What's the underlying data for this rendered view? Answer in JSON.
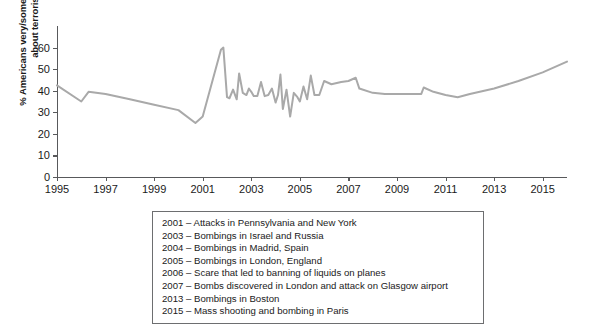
{
  "chart_data": {
    "type": "line",
    "title": "",
    "xlabel": "",
    "ylabel": "% Americans very/somewhat worried about terrorism",
    "xlim": [
      1995,
      2016
    ],
    "ylim": [
      0,
      70
    ],
    "grid": false,
    "legend_position": "below-plot",
    "line_color": "#a9a9a9",
    "x": [
      1995,
      1996.0,
      1996.3,
      1997,
      1998,
      1999,
      2000,
      2000.7,
      2001.0,
      2001.75,
      2001.85,
      2002.0,
      2002.1,
      2002.25,
      2002.4,
      2002.5,
      2002.65,
      2002.8,
      2002.9,
      2003.0,
      2003.1,
      2003.25,
      2003.4,
      2003.55,
      2003.7,
      2003.85,
      2004.0,
      2004.1,
      2004.2,
      2004.3,
      2004.45,
      2004.6,
      2004.75,
      2004.9,
      2005.0,
      2005.15,
      2005.3,
      2005.45,
      2005.6,
      2005.8,
      2006.0,
      2006.3,
      2006.7,
      2007.0,
      2007.3,
      2007.45,
      2008.0,
      2008.5,
      2009.0,
      2009.5,
      2010.0,
      2010.1,
      2010.5,
      2011.0,
      2011.5,
      2012.0,
      2013.0,
      2014.0,
      2015.0,
      2016.0
    ],
    "y": [
      42.5,
      35.0,
      39.5,
      38.5,
      36.0,
      33.5,
      31.0,
      25.0,
      28.0,
      59.0,
      60.0,
      37.0,
      36.5,
      40.5,
      36.0,
      48.0,
      39.0,
      38.0,
      41.0,
      39.5,
      37.5,
      37.5,
      44.0,
      37.5,
      38.0,
      41.0,
      34.5,
      38.0,
      47.5,
      31.5,
      40.5,
      28.0,
      39.0,
      37.0,
      35.0,
      42.0,
      36.0,
      47.0,
      38.0,
      38.0,
      44.5,
      43.0,
      44.0,
      44.5,
      46.0,
      41.0,
      39.0,
      38.5,
      38.5,
      38.5,
      38.5,
      41.5,
      39.5,
      38.0,
      37.0,
      38.5,
      41.0,
      44.5,
      48.5,
      53.5
    ],
    "yticks": [
      0,
      10,
      20,
      30,
      40,
      50,
      60
    ],
    "xticks": [
      1995,
      1997,
      1999,
      2001,
      2003,
      2005,
      2007,
      2009,
      2011,
      2013,
      2015
    ],
    "annotations": [
      "2001 – Attacks in Pennsylvania and New York",
      "2003 – Bombings in Israel and Russia",
      "2004 – Bombings in Madrid, Spain",
      "2005 – Bombings in London, England",
      "2006 – Scare that led to banning of liquids on planes",
      "2007 – Bombs discovered in London and attack on Glasgow airport",
      "2013 – Bombings in Boston",
      "2015 – Mass shooting and bombing in Paris"
    ]
  }
}
